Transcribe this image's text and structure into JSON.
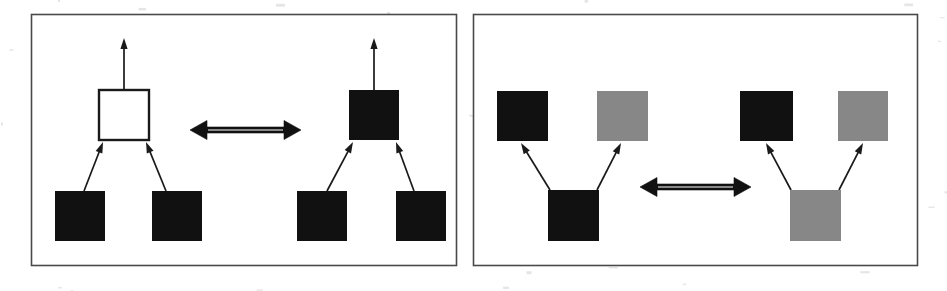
{
  "figure": {
    "background_color": "#ffffff",
    "panel_border_color": "#4a4a4a",
    "colors": {
      "black_node": "#111111",
      "gray_node": "#878787",
      "white_node": "#ffffff",
      "edge": "#1a1a1a",
      "equivalence_arrow": "#111111"
    },
    "panels": [
      {
        "id": "panel-left",
        "name": "left-rule-panel",
        "frame": {
          "x": 31,
          "y": 14,
          "w": 425,
          "h": 251
        },
        "relation": {
          "name": "equivalence-arrow",
          "symbol": "double-headed-arrow",
          "direction": "bidirectional",
          "x1": 190,
          "x2": 301,
          "y": 130
        },
        "sides": [
          {
            "id": "panel-left-lhs",
            "name": "left-hand-side-graph",
            "nodes": [
              {
                "id": "L1-top",
                "name": "node-top",
                "fill": "white",
                "x": 99,
                "y": 90,
                "w": 50,
                "h": 50
              },
              {
                "id": "L1-bl",
                "name": "node-bottom-left",
                "fill": "black",
                "x": 55,
                "y": 191,
                "w": 50,
                "h": 50
              },
              {
                "id": "L1-br",
                "name": "node-bottom-right",
                "fill": "black",
                "x": 152,
                "y": 191,
                "w": 50,
                "h": 50
              }
            ],
            "edges": [
              {
                "name": "edge-root-out",
                "from": "L1-top",
                "to": "open",
                "x1": 124,
                "y1": 90,
                "x2": 124,
                "y2": 38,
                "arrow": true
              },
              {
                "name": "edge-bottom-left",
                "from": "L1-bl",
                "to": "L1-top",
                "x1": 84,
                "y1": 191,
                "x2": 103,
                "y2": 142,
                "arrow": true
              },
              {
                "name": "edge-bottom-right",
                "from": "L1-br",
                "to": "L1-top",
                "x1": 166,
                "y1": 191,
                "x2": 146,
                "y2": 142,
                "arrow": true
              }
            ]
          },
          {
            "id": "panel-left-rhs",
            "name": "right-hand-side-graph",
            "nodes": [
              {
                "id": "L2-top",
                "name": "node-top",
                "fill": "black",
                "x": 349,
                "y": 90,
                "w": 50,
                "h": 50
              },
              {
                "id": "L2-bl",
                "name": "node-bottom-left",
                "fill": "black",
                "x": 297,
                "y": 191,
                "w": 50,
                "h": 50
              },
              {
                "id": "L2-br",
                "name": "node-bottom-right",
                "fill": "black",
                "x": 396,
                "y": 191,
                "w": 50,
                "h": 50
              }
            ],
            "edges": [
              {
                "name": "edge-root-out",
                "from": "L2-top",
                "to": "open",
                "x1": 374,
                "y1": 90,
                "x2": 374,
                "y2": 38,
                "arrow": true
              },
              {
                "name": "edge-bottom-left",
                "from": "L2-bl",
                "to": "L2-top",
                "x1": 327,
                "y1": 191,
                "x2": 353,
                "y2": 142,
                "arrow": true
              },
              {
                "name": "edge-bottom-right",
                "from": "L2-br",
                "to": "L2-top",
                "x1": 414,
                "y1": 191,
                "x2": 396,
                "y2": 142,
                "arrow": true
              }
            ]
          }
        ]
      },
      {
        "id": "panel-right",
        "name": "right-rule-panel",
        "frame": {
          "x": 473,
          "y": 14,
          "w": 444,
          "h": 251
        },
        "relation": {
          "name": "equivalence-arrow",
          "symbol": "double-headed-arrow",
          "direction": "bidirectional",
          "x1": 640,
          "x2": 751,
          "y": 187
        },
        "sides": [
          {
            "id": "panel-right-lhs",
            "name": "left-hand-side-graph",
            "nodes": [
              {
                "id": "R1-tl",
                "name": "node-top-left",
                "fill": "black",
                "x": 497,
                "y": 91,
                "w": 51,
                "h": 50
              },
              {
                "id": "R1-tr",
                "name": "node-top-right",
                "fill": "gray",
                "x": 597,
                "y": 91,
                "w": 51,
                "h": 50
              },
              {
                "id": "R1-bot",
                "name": "node-bottom",
                "fill": "black",
                "x": 548,
                "y": 190,
                "w": 51,
                "h": 51
              }
            ],
            "edges": [
              {
                "name": "edge-to-top-left",
                "from": "R1-bot",
                "to": "R1-tl",
                "x1": 550,
                "y1": 190,
                "x2": 521,
                "y2": 143,
                "arrow": true
              },
              {
                "name": "edge-to-top-right",
                "from": "R1-bot",
                "to": "R1-tr",
                "x1": 597,
                "y1": 190,
                "x2": 621,
                "y2": 143,
                "arrow": true
              }
            ]
          },
          {
            "id": "panel-right-rhs",
            "name": "right-hand-side-graph",
            "nodes": [
              {
                "id": "R2-tl",
                "name": "node-top-left",
                "fill": "black",
                "x": 740,
                "y": 91,
                "w": 53,
                "h": 50
              },
              {
                "id": "R2-tr",
                "name": "node-top-right",
                "fill": "gray",
                "x": 838,
                "y": 91,
                "w": 50,
                "h": 50
              },
              {
                "id": "R2-bot",
                "name": "node-bottom",
                "fill": "gray",
                "x": 790,
                "y": 190,
                "w": 51,
                "h": 51
              }
            ],
            "edges": [
              {
                "name": "edge-to-top-left",
                "from": "R2-bot",
                "to": "R2-tl",
                "x1": 791,
                "y1": 190,
                "x2": 766,
                "y2": 143,
                "arrow": true
              },
              {
                "name": "edge-to-top-right",
                "from": "R2-bot",
                "to": "R2-tr",
                "x1": 839,
                "y1": 190,
                "x2": 863,
                "y2": 143,
                "arrow": true
              }
            ]
          }
        ]
      }
    ]
  }
}
